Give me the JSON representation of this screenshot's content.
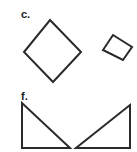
{
  "figure": {
    "panels": [
      {
        "label": "c.",
        "shapes": [
          {
            "type": "square-rotated",
            "points": "50,20 81,52 53,82 24,52"
          },
          {
            "type": "quadrilateral-small",
            "points": "113,35 132,47 123,60 103,50"
          }
        ]
      },
      {
        "label": "f.",
        "shapes": [
          {
            "type": "right-triangle-left",
            "points": "22,103 22,148 70,148"
          },
          {
            "type": "right-triangle-right",
            "points": "76,148 130,148 130,105"
          }
        ]
      }
    ],
    "stroke_color": "#2a2a2a",
    "background": "#ffffff"
  }
}
